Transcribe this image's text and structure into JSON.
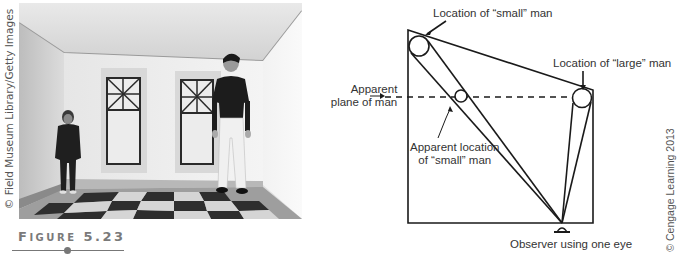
{
  "photo": {
    "credit": "© Field Museum Library/Getty Images",
    "description": "Ames room photograph: small-appearing boy in left corner, large-appearing man in right corner, two windows, checkered floor"
  },
  "figure": {
    "label_first": "F",
    "label_rest": "IGURE",
    "number": "5.23"
  },
  "diagram": {
    "labels": {
      "small_location": "Location of “small” man",
      "large_location": "Location of “large” man",
      "apparent_plane_1": "Apparent",
      "apparent_plane_2": "plane of man",
      "apparent_small_1": "Apparent location",
      "apparent_small_2": "of “small” man",
      "observer": "Observer using one eye"
    },
    "credit": "© Cengage Learning 2013",
    "colors": {
      "line": "#1a1a1a",
      "text": "#333333"
    }
  }
}
